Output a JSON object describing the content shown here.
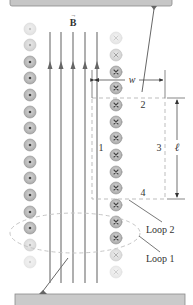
{
  "diagram": {
    "field_label": "B",
    "field_vector_symbol": "→",
    "width_label": "w",
    "length_label": "ℓ",
    "side_labels": [
      "1",
      "2",
      "3",
      "4"
    ],
    "loop_labels": [
      "Loop 2",
      "Loop 1"
    ],
    "colors": {
      "bar": "#c8c8c8",
      "bar_edge": "#8a8a8a",
      "field_line": "#7a7a7a",
      "conductor_fill": "#b9b9b9",
      "conductor_ring": "#8e8e8e",
      "dash": "#bdbdbd",
      "text": "#333333"
    },
    "left_column": {
      "direction": "out-of-page (dot)",
      "count": 15
    },
    "right_column": {
      "direction": "into-page (cross)",
      "count": 15
    },
    "field_lines": {
      "count": 5,
      "direction": "up"
    }
  }
}
